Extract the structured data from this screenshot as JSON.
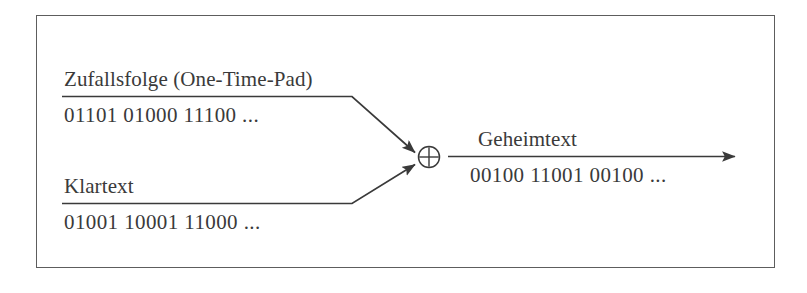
{
  "figure": {
    "type": "diagram",
    "background_color": "#ffffff",
    "ink_color": "#3a3a3a",
    "frame_color": "#5d5d5d"
  },
  "inputs": [
    {
      "id": "key",
      "label": "Zufallsfolge (One-Time-Pad)",
      "bits": "01101 01000 11100 ..."
    },
    {
      "id": "plaintext",
      "label": "Klartext",
      "bits": "01001 10001 11000 ..."
    }
  ],
  "operator": {
    "symbol": "⊕",
    "name": "xor-operator"
  },
  "output": {
    "id": "ciphertext",
    "label": "Geheimtext",
    "bits": "00100 11001 00100 ..."
  }
}
